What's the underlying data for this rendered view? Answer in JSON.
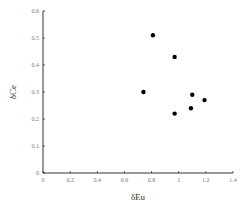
{
  "chart_data": {
    "type": "scatter",
    "title": "",
    "xlabel": "δEu",
    "ylabel": "δCe",
    "xlim": [
      0,
      1.4
    ],
    "ylim": [
      0,
      0.6
    ],
    "xticks": [
      "0",
      "0.2",
      "0.4",
      "0.6",
      "0.8",
      "1",
      "1.2",
      "1.4"
    ],
    "yticks": [
      "0",
      "0.1",
      "0.2",
      "0.3",
      "0.4",
      "0.5",
      "0.6"
    ],
    "grid": false,
    "legend": null,
    "series": [
      {
        "name": "samples",
        "marker": "filled-circle",
        "color": "#000000",
        "points": [
          {
            "x": 0.81,
            "y": 0.51
          },
          {
            "x": 0.97,
            "y": 0.43
          },
          {
            "x": 0.74,
            "y": 0.3
          },
          {
            "x": 1.1,
            "y": 0.29
          },
          {
            "x": 1.19,
            "y": 0.27
          },
          {
            "x": 1.09,
            "y": 0.24
          },
          {
            "x": 0.97,
            "y": 0.22
          }
        ]
      }
    ]
  }
}
